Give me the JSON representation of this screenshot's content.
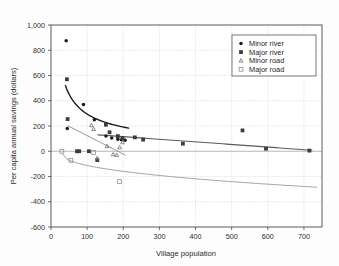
{
  "chart_data": {
    "type": "scatter",
    "title": "",
    "xlabel": "Village population",
    "ylabel": "Per capita annual savings (dollars)",
    "xlim": [
      0,
      750
    ],
    "ylim": [
      -600,
      1000
    ],
    "xticks": [
      0,
      100,
      200,
      300,
      400,
      500,
      600,
      700
    ],
    "xticklabels": [
      "0",
      "100",
      "200",
      "300",
      "400",
      "500",
      "600",
      "700"
    ],
    "yticks": [
      -600,
      -400,
      -200,
      0,
      200,
      400,
      600,
      800,
      1000
    ],
    "yticklabels": [
      "-600",
      "-400",
      "-200",
      "0",
      "200",
      "400",
      "600",
      "800",
      "1,000"
    ],
    "grid": true,
    "grid_axis": "y",
    "legend_position": "upper right",
    "series": [
      {
        "name": "Minor river",
        "marker": "filled-circle",
        "color": "#1a1a1a",
        "points": [
          {
            "x": 42,
            "y": 875
          },
          {
            "x": 45,
            "y": 180
          },
          {
            "x": 90,
            "y": 370
          },
          {
            "x": 120,
            "y": 250
          },
          {
            "x": 152,
            "y": 120
          },
          {
            "x": 168,
            "y": 105
          },
          {
            "x": 185,
            "y": 95
          },
          {
            "x": 195,
            "y": 92
          },
          {
            "x": 205,
            "y": 88
          }
        ],
        "fit": {
          "type": "power-decay",
          "a": 520,
          "b": -0.62,
          "x0": 40,
          "x1": 215,
          "color": "#1a1a1a",
          "width": 1.4
        }
      },
      {
        "name": "Major river",
        "marker": "filled-square",
        "color": "#3d3d3d",
        "points": [
          {
            "x": 44,
            "y": 570
          },
          {
            "x": 46,
            "y": 255
          },
          {
            "x": 72,
            "y": 0
          },
          {
            "x": 78,
            "y": 0
          },
          {
            "x": 105,
            "y": 0
          },
          {
            "x": 128,
            "y": -70
          },
          {
            "x": 152,
            "y": 210
          },
          {
            "x": 162,
            "y": 150
          },
          {
            "x": 185,
            "y": 120
          },
          {
            "x": 198,
            "y": 105
          },
          {
            "x": 232,
            "y": 110
          },
          {
            "x": 255,
            "y": 92
          },
          {
            "x": 365,
            "y": 60
          },
          {
            "x": 530,
            "y": 165
          },
          {
            "x": 595,
            "y": 20
          },
          {
            "x": 715,
            "y": 5
          }
        ],
        "fit": {
          "type": "linear-decay",
          "y0": 130,
          "y1": 8,
          "x0": 130,
          "x1": 722,
          "color": "#5a5a5a",
          "width": 1.1
        }
      },
      {
        "name": "Minor road",
        "marker": "open-triangle",
        "color": "#6f6f6f",
        "points": [
          {
            "x": 112,
            "y": 205
          },
          {
            "x": 118,
            "y": 175
          },
          {
            "x": 128,
            "y": -55
          },
          {
            "x": 155,
            "y": 40
          },
          {
            "x": 172,
            "y": -25
          },
          {
            "x": 182,
            "y": -30
          },
          {
            "x": 190,
            "y": 30
          },
          {
            "x": 198,
            "y": 70
          }
        ],
        "fit": {
          "type": "linear-decay",
          "y0": 200,
          "y1": -30,
          "x0": 48,
          "x1": 205,
          "color": "#8a8a8a",
          "width": 1.0
        }
      },
      {
        "name": "Major road",
        "marker": "open-square",
        "color": "#8f8f8f",
        "points": [
          {
            "x": 30,
            "y": 0
          },
          {
            "x": 55,
            "y": -72
          },
          {
            "x": 118,
            "y": -10
          },
          {
            "x": 190,
            "y": -240
          }
        ],
        "fit": {
          "type": "power-decline",
          "y0": -20,
          "y1": -285,
          "x0": 32,
          "x1": 735,
          "color": "#a5a5a5",
          "width": 1.0
        }
      }
    ],
    "legend_entries": [
      {
        "label": "Minor river",
        "marker": "filled-circle",
        "color": "#1a1a1a"
      },
      {
        "label": "Major river",
        "marker": "filled-square",
        "color": "#3d3d3d"
      },
      {
        "label": "Minor road",
        "marker": "open-triangle",
        "color": "#6f6f6f"
      },
      {
        "label": "Major road",
        "marker": "open-square",
        "color": "#8f8f8f"
      }
    ]
  },
  "colors": {
    "frame": "#4a4a4a",
    "grid": "#c9c9c9",
    "text": "#2b2b2b",
    "background": "#fdfdfd"
  }
}
